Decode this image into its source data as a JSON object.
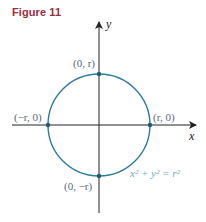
{
  "figure": {
    "title": "Figure 11"
  },
  "axes": {
    "x_label": "x",
    "y_label": "y"
  },
  "points": [
    {
      "label": "(0, r)"
    },
    {
      "label": "(−r, 0)"
    },
    {
      "label": "(r, 0)"
    },
    {
      "label": "(0, −r)"
    }
  ],
  "equation": {
    "text": "x² + y² = r²"
  },
  "colors": {
    "title": "#9b2c3c",
    "circle": "#2e7ba0",
    "label": "#5a6878",
    "equation": "#6fa8c4",
    "axis": "#222222"
  }
}
